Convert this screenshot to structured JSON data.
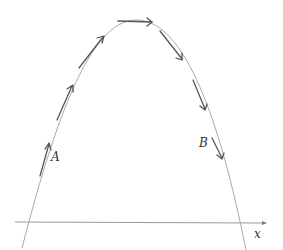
{
  "diagram": {
    "type": "trajectory",
    "labels": {
      "point_a": "A",
      "point_b": "B",
      "x_axis": "x"
    },
    "colors": {
      "curve": "#aaaaaa",
      "arrow": "#555555",
      "axis": "#9a9a9a",
      "text": "#333333"
    },
    "arrow_count": 7
  }
}
